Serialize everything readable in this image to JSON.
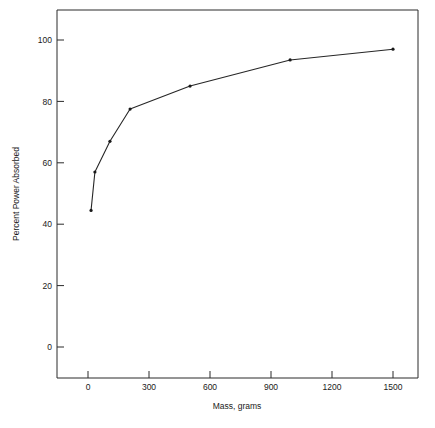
{
  "chart_data": {
    "type": "line",
    "title": "",
    "xlabel": "Mass, grams",
    "ylabel": "Percent Power Absorbed",
    "xlim": [
      -120,
      1640
    ],
    "ylim": [
      -18,
      108
    ],
    "xticks": [
      0,
      300,
      600,
      900,
      1200,
      1500
    ],
    "xticklabels": [
      "0",
      "300",
      "600",
      "900",
      "1200",
      "1500"
    ],
    "yticks": [
      0,
      20,
      40,
      60,
      80,
      100
    ],
    "yticklabels": [
      "0",
      "20",
      "40",
      "60",
      "80",
      "100"
    ],
    "grid": false,
    "legend": null,
    "series": [
      {
        "name": "Percent Power Absorbed",
        "marker": "dot",
        "color": "#262626",
        "x": [
          15,
          34,
          108,
          207,
          502,
          994,
          1500
        ],
        "y": [
          44.5,
          57.0,
          67.0,
          77.5,
          85.0,
          93.5,
          97.0
        ]
      }
    ]
  },
  "axes": {
    "y_axis_title": "Percent Power Absorbed",
    "x_axis_title": "Mass, grams"
  },
  "style": {
    "line_color": "#262626",
    "axis_color": "#2b2b2b",
    "text_color": "#1a1a1a",
    "background": "#ffffff"
  }
}
